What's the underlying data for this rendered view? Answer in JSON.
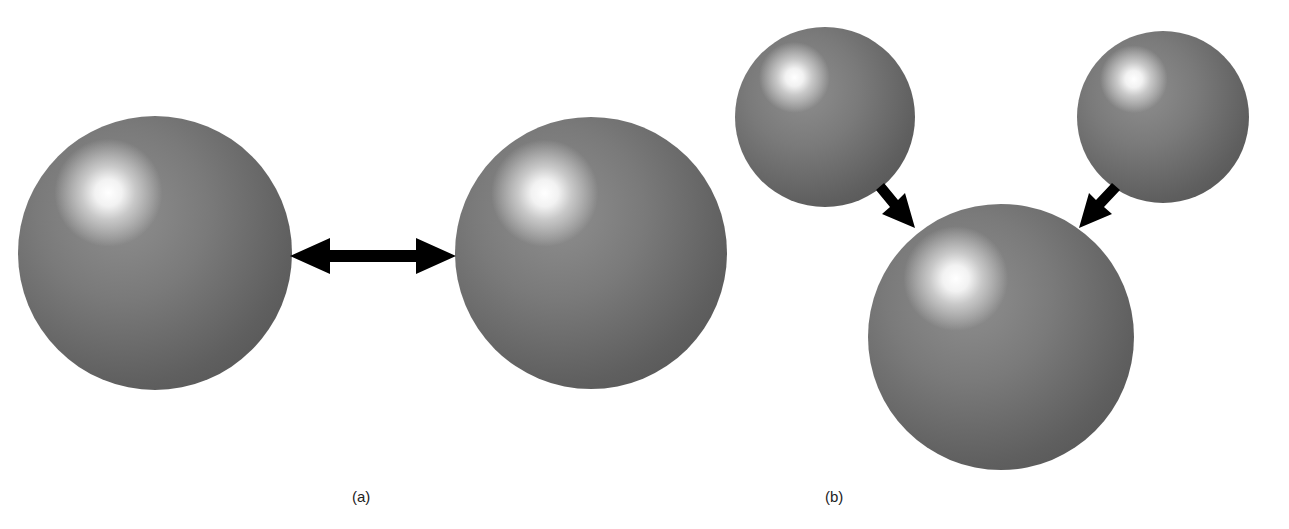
{
  "panels": [
    {
      "id": "a",
      "label": "(a)",
      "description": "Two equal spheres with a double-headed arrow between them",
      "spheres": [
        {
          "cx": 155,
          "cy": 253,
          "r": 137
        },
        {
          "cx": 591,
          "cy": 253,
          "r": 136
        }
      ],
      "arrow": {
        "type": "double-headed",
        "from": [
          290,
          256
        ],
        "to": [
          456,
          256
        ]
      }
    },
    {
      "id": "b",
      "label": "(b)",
      "description": "Two smaller spheres with arrows pointing into a larger sphere",
      "spheres": [
        {
          "cx": 825,
          "cy": 117,
          "r": 90
        },
        {
          "cx": 1163,
          "cy": 117,
          "r": 86
        },
        {
          "cx": 1001,
          "cy": 337,
          "r": 133
        }
      ],
      "arrows": [
        {
          "type": "single-headed",
          "from": [
            880,
            185
          ],
          "to": [
            915,
            228
          ]
        },
        {
          "type": "single-headed",
          "from": [
            1115,
            185
          ],
          "to": [
            1080,
            228
          ]
        }
      ]
    }
  ],
  "colors": {
    "sphere": "#6e6e6e",
    "arrow": "#000000",
    "background": "#ffffff"
  }
}
